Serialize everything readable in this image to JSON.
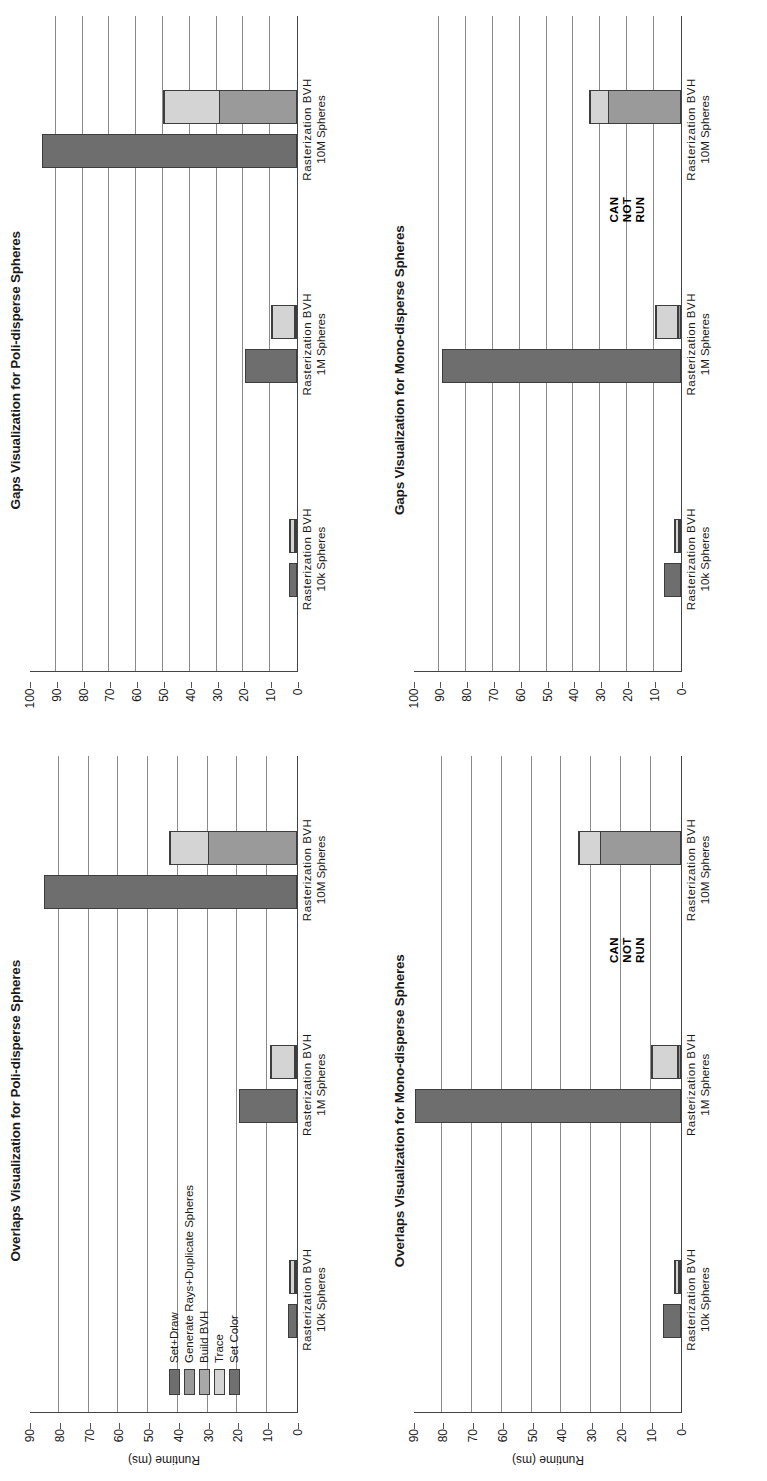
{
  "figure": {
    "series_colors": {
      "Set+Draw": "#6e6e6e",
      "Generate Rays+Duplicate Spheres": "#9a9a9a",
      "Build BVH": "#a8a8a8",
      "Trace": "#d4d4d4",
      "Set Color": "#707070"
    },
    "legend": {
      "items": [
        {
          "label": "Set+Draw",
          "color": "#6e6e6e"
        },
        {
          "label": "Generate Rays+Duplicate Spheres",
          "color": "#9a9a9a"
        },
        {
          "label": "Build BVH",
          "color": "#a8a8a8"
        },
        {
          "label": "Trace",
          "color": "#d4d4d4"
        },
        {
          "label": "Set Color",
          "color": "#707070"
        }
      ]
    },
    "annotation": {
      "line1": "CAN",
      "line2": "NOT",
      "line3": "RUN"
    }
  },
  "chart_data": [
    {
      "id": "overlaps-poli",
      "type": "bar",
      "title": "Overlaps Visualization for Poli-disperse Spheres",
      "xlabel": "",
      "ylabel": "Runtime (ms)",
      "ylim": [
        0,
        90
      ],
      "yticks": [
        0,
        10,
        20,
        30,
        40,
        50,
        60,
        70,
        80,
        90
      ],
      "grid": true,
      "legend_position": "inside-left",
      "categories": [
        "10k Spheres",
        "1M Spheres",
        "10M Spheres"
      ],
      "methods": [
        "Rasterization",
        "BVH"
      ],
      "series": [
        {
          "name": "Set+Draw",
          "values": [
            3.0,
            0.0,
            19.5,
            0.0,
            85.0,
            0.0
          ]
        },
        {
          "name": "Generate Rays+Duplicate Spheres",
          "values": [
            0.0,
            0.6,
            0.0,
            0.8,
            0.0,
            30.0
          ]
        },
        {
          "name": "Build BVH",
          "values": [
            0.0,
            0.4,
            0.0,
            0.5,
            0.0,
            0.0
          ]
        },
        {
          "name": "Trace",
          "values": [
            0.0,
            1.8,
            0.0,
            8.0,
            0.0,
            13.0
          ]
        },
        {
          "name": "Set Color",
          "values": [
            0.0,
            0.3,
            0.0,
            0.4,
            0.0,
            0.5
          ]
        }
      ],
      "bar_labels": [
        "Rasterization",
        "BVH",
        "Rasterization",
        "BVH",
        "Rasterization",
        "BVH"
      ],
      "annotations": []
    },
    {
      "id": "gaps-poli",
      "type": "bar",
      "title": "Gaps Visualization for Poli-disperse Spheres",
      "xlabel": "",
      "ylabel": "",
      "ylim": [
        0,
        100
      ],
      "yticks": [
        0,
        10,
        20,
        30,
        40,
        50,
        60,
        70,
        80,
        90,
        100
      ],
      "grid": true,
      "legend_position": "none",
      "categories": [
        "10k Spheres",
        "1M Spheres",
        "10M Spheres"
      ],
      "methods": [
        "Rasterization",
        "BVH"
      ],
      "series": [
        {
          "name": "Set+Draw",
          "values": [
            3.0,
            0.0,
            19.5,
            0.0,
            95.0,
            0.0
          ]
        },
        {
          "name": "Generate Rays+Duplicate Spheres",
          "values": [
            0.0,
            0.6,
            0.0,
            0.8,
            0.0,
            29.0
          ]
        },
        {
          "name": "Build BVH",
          "values": [
            0.0,
            0.4,
            0.0,
            0.5,
            0.0,
            0.0
          ]
        },
        {
          "name": "Trace",
          "values": [
            0.0,
            1.8,
            0.0,
            8.5,
            0.0,
            21.0
          ]
        },
        {
          "name": "Set Color",
          "values": [
            0.0,
            0.3,
            0.0,
            0.4,
            0.0,
            0.5
          ]
        }
      ],
      "bar_labels": [
        "Rasterization",
        "BVH",
        "Rasterization",
        "BVH",
        "Rasterization",
        "BVH"
      ],
      "annotations": []
    },
    {
      "id": "overlaps-mono",
      "type": "bar",
      "title": "Overlaps Visualization for Mono-disperse Spheres",
      "xlabel": "",
      "ylabel": "Runtime (ms)",
      "ylim": [
        0,
        90
      ],
      "yticks": [
        0,
        10,
        20,
        30,
        40,
        50,
        60,
        70,
        80,
        90
      ],
      "grid": true,
      "legend_position": "none",
      "categories": [
        "10k Spheres",
        "1M Spheres",
        "10M Spheres"
      ],
      "methods": [
        "Rasterization",
        "BVH"
      ],
      "series": [
        {
          "name": "Set+Draw",
          "values": [
            6.0,
            0.0,
            89.0,
            0.0,
            0.0,
            0.0
          ]
        },
        {
          "name": "Generate Rays+Duplicate Spheres",
          "values": [
            0.0,
            0.5,
            0.0,
            1.0,
            0.0,
            27.0
          ]
        },
        {
          "name": "Build BVH",
          "values": [
            0.0,
            0.3,
            0.0,
            0.5,
            0.0,
            0.0
          ]
        },
        {
          "name": "Trace",
          "values": [
            0.0,
            1.2,
            0.0,
            8.5,
            0.0,
            7.5
          ]
        },
        {
          "name": "Set Color",
          "values": [
            0.0,
            0.3,
            0.0,
            0.4,
            0.0,
            0.5
          ]
        }
      ],
      "bar_labels": [
        "Rasterization",
        "BVH",
        "Rasterization",
        "BVH",
        "Rasterization",
        "BVH"
      ],
      "annotations": [
        {
          "text": "CAN NOT RUN",
          "group": 2,
          "bar": 0,
          "note": "Rasterization at 10M Spheres cannot run"
        }
      ]
    },
    {
      "id": "gaps-mono",
      "type": "bar",
      "title": "Gaps Visualization for Mono-disperse Spheres",
      "xlabel": "",
      "ylabel": "",
      "ylim": [
        0,
        100
      ],
      "yticks": [
        0,
        10,
        20,
        30,
        40,
        50,
        60,
        70,
        80,
        90,
        100
      ],
      "grid": true,
      "legend_position": "none",
      "categories": [
        "10k Spheres",
        "1M Spheres",
        "10M Spheres"
      ],
      "methods": [
        "Rasterization",
        "BVH"
      ],
      "series": [
        {
          "name": "Set+Draw",
          "values": [
            6.0,
            0.0,
            89.0,
            0.0,
            0.0,
            0.0
          ]
        },
        {
          "name": "Generate Rays+Duplicate Spheres",
          "values": [
            0.0,
            0.5,
            0.0,
            1.0,
            0.0,
            27.0
          ]
        },
        {
          "name": "Build BVH",
          "values": [
            0.0,
            0.3,
            0.0,
            0.5,
            0.0,
            0.0
          ]
        },
        {
          "name": "Trace",
          "values": [
            0.0,
            1.2,
            0.0,
            8.0,
            0.0,
            7.0
          ]
        },
        {
          "name": "Set Color",
          "values": [
            0.0,
            0.3,
            0.0,
            0.4,
            0.0,
            0.5
          ]
        }
      ],
      "bar_labels": [
        "Rasterization",
        "BVH",
        "Rasterization",
        "BVH",
        "Rasterization",
        "BVH"
      ],
      "annotations": [
        {
          "text": "CAN NOT RUN",
          "group": 2,
          "bar": 0,
          "note": "Rasterization at 10M Spheres cannot run"
        }
      ]
    }
  ]
}
